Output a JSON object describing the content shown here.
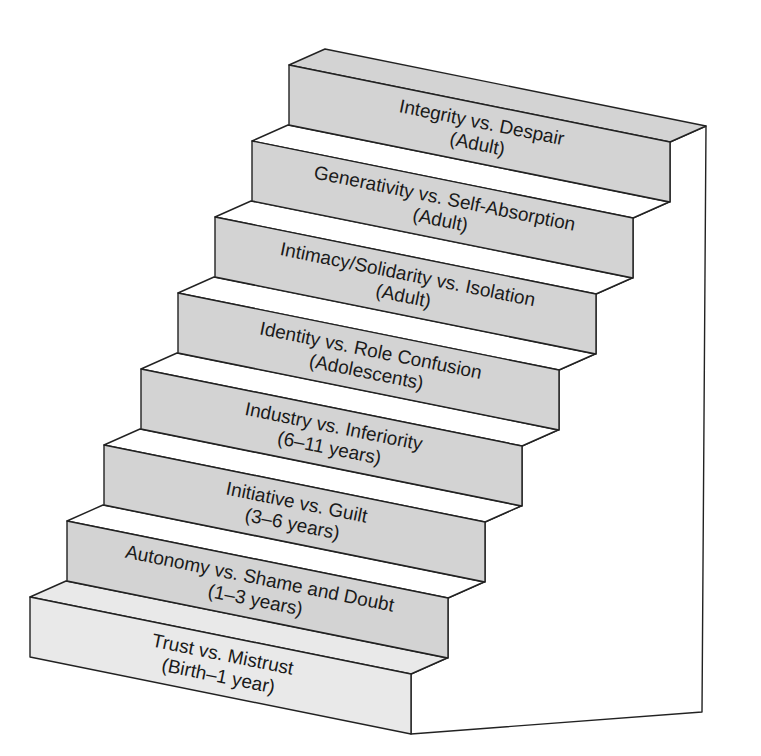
{
  "diagram": {
    "type": "staircase",
    "colors": {
      "riser": "#d3d3d3",
      "first_step": "#e9e9e9",
      "tread": "#ffffff",
      "wall": "#ffffff",
      "stroke": "#222222",
      "text": "#1a1a1a"
    },
    "steps": [
      {
        "stage": "Trust vs. Mistrust",
        "age": "(Birth–1 year)"
      },
      {
        "stage": "Autonomy vs. Shame and Doubt",
        "age": "(1–3 years)"
      },
      {
        "stage": "Initiative vs. Guilt",
        "age": "(3–6 years)"
      },
      {
        "stage": "Industry vs. Inferiority",
        "age": "(6–11 years)"
      },
      {
        "stage": "Identity vs. Role Confusion",
        "age": "(Adolescents)"
      },
      {
        "stage": "Intimacy/Solidarity vs. Isolation",
        "age": "(Adult)"
      },
      {
        "stage": "Generativity vs. Self-Absorption",
        "age": "(Adult)"
      },
      {
        "stage": "Integrity vs. Despair",
        "age": "(Adult)"
      }
    ]
  }
}
